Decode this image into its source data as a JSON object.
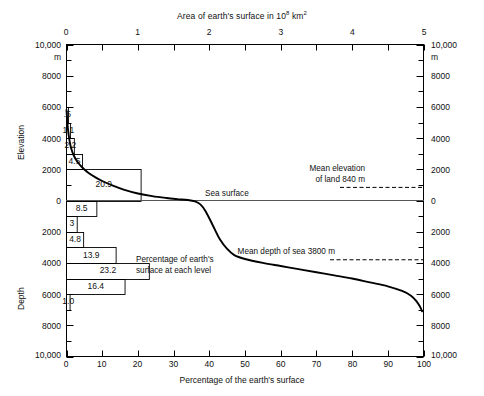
{
  "chart_data": {
    "type": "line",
    "top_axis": {
      "label_text": "Area of earth's surface in 10",
      "label_exponent": "8",
      "label_unit": " km",
      "unit_exponent": "2",
      "ticks": [
        "0",
        "1",
        "2",
        "3",
        "4",
        "5"
      ],
      "range": [
        0,
        5
      ]
    },
    "bottom_axis": {
      "label": "Percentage of the earth's surface",
      "ticks": [
        "0",
        "10",
        "20",
        "30",
        "40",
        "50",
        "60",
        "70",
        "80",
        "90",
        "100"
      ],
      "range": [
        0,
        100
      ]
    },
    "left_axis": {
      "upper_label": "Elevation",
      "lower_label": "Depth",
      "unit": "m",
      "ticks_elevation": [
        "10,000",
        "8000",
        "6000",
        "4000",
        "2000",
        "0"
      ],
      "ticks_depth": [
        "0",
        "2000",
        "4000",
        "6000",
        "8000",
        "10,000"
      ],
      "range": [
        10000,
        -10000
      ]
    },
    "right_axis": {
      "unit": "m",
      "ticks_elevation": [
        "10,000",
        "8000",
        "6000",
        "4000",
        "2000",
        "0"
      ],
      "ticks_depth": [
        "0",
        "2000",
        "4000",
        "6000",
        "8000",
        "10,000"
      ]
    },
    "curve_name": "hypsographic curve",
    "curve_points": [
      [
        0,
        5800
      ],
      [
        0.4,
        4600
      ],
      [
        0.8,
        3900
      ],
      [
        1.3,
        3350
      ],
      [
        2.0,
        2900
      ],
      [
        3.0,
        2500
      ],
      [
        4.5,
        2100
      ],
      [
        6.0,
        1800
      ],
      [
        8.0,
        1500
      ],
      [
        10.0,
        1250
      ],
      [
        13.0,
        950
      ],
      [
        16.0,
        700
      ],
      [
        20.0,
        450
      ],
      [
        24.0,
        280
      ],
      [
        28.0,
        160
      ],
      [
        31.0,
        90
      ],
      [
        34.0,
        30
      ],
      [
        36.0,
        -60
      ],
      [
        37.5,
        -250
      ],
      [
        39.0,
        -700
      ],
      [
        41.0,
        -1600
      ],
      [
        43.0,
        -2500
      ],
      [
        45.0,
        -3100
      ],
      [
        47.0,
        -3500
      ],
      [
        50.0,
        -3750
      ],
      [
        55.0,
        -4000
      ],
      [
        60.0,
        -4200
      ],
      [
        65.0,
        -4400
      ],
      [
        70.0,
        -4600
      ],
      [
        75.0,
        -4800
      ],
      [
        80.0,
        -5000
      ],
      [
        85.0,
        -5250
      ],
      [
        90.0,
        -5500
      ],
      [
        94.0,
        -5800
      ],
      [
        96.5,
        -6100
      ],
      [
        98.0,
        -6450
      ],
      [
        99.0,
        -6800
      ],
      [
        99.6,
        -7100
      ]
    ],
    "sea_surface": {
      "label": "Sea surface",
      "value_m": 0
    },
    "mean_elevation": {
      "line1": "Mean elevation",
      "line2": "of land 840 m",
      "value_m": 840
    },
    "mean_depth": {
      "label": "Mean depth of sea 3800 m",
      "value_m": -3800
    },
    "legend": {
      "line1": "Percentage of earth's",
      "line2": "surface at each level"
    },
    "bars_label_note": "Percentage of earth's surface at each level",
    "bars": [
      {
        "value": ".5",
        "percent": 0.5,
        "top_m": 6000,
        "bottom_m": 5000
      },
      {
        "value": "1.1",
        "percent": 1.1,
        "top_m": 5000,
        "bottom_m": 4000
      },
      {
        "value": "2.2",
        "percent": 2.2,
        "top_m": 4000,
        "bottom_m": 3000
      },
      {
        "value": "4.5",
        "percent": 4.5,
        "top_m": 3000,
        "bottom_m": 2000
      },
      {
        "value": "20.9",
        "percent": 20.9,
        "top_m": 2000,
        "bottom_m": 0
      },
      {
        "value": "8.5",
        "percent": 8.5,
        "top_m": 0,
        "bottom_m": -1000
      },
      {
        "value": "3",
        "percent": 3.0,
        "top_m": -1000,
        "bottom_m": -2000
      },
      {
        "value": "4.8",
        "percent": 4.8,
        "top_m": -2000,
        "bottom_m": -3000
      },
      {
        "value": "13.9",
        "percent": 13.9,
        "top_m": -3000,
        "bottom_m": -4000
      },
      {
        "value": "23.2",
        "percent": 23.2,
        "top_m": -4000,
        "bottom_m": -5000
      },
      {
        "value": "16.4",
        "percent": 16.4,
        "top_m": -5000,
        "bottom_m": -6000
      },
      {
        "value": "1.0",
        "percent": 1.0,
        "top_m": -6000,
        "bottom_m": -7000
      }
    ],
    "grid": false,
    "legend_position": "center"
  }
}
